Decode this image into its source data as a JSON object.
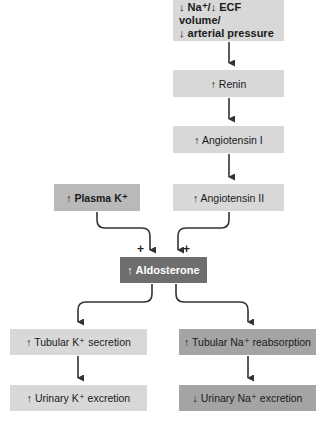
{
  "diagram": {
    "nodes": {
      "trigger": {
        "line1": "↓ Na⁺/↓ ECF volume/",
        "line2": "↓ arterial pressure"
      },
      "renin": "↑ Renin",
      "angiotensin_1": "↑ Angiotensin I",
      "angiotensin_2": "↑ Angiotensin II",
      "plasma_k": "↑ Plasma K⁺",
      "aldosterone": "↑ Aldosterone",
      "tubular_k_secretion": "↑ Tubular K⁺ secretion",
      "urinary_k_excretion": "↑ Urinary K⁺ excretion",
      "tubular_na_reabsorption": "↑ Tubular Na⁺ reabsorption",
      "urinary_na_excretion": "↓ Urinary Na⁺ excretion"
    },
    "signs": {
      "plasma_k_to_aldosterone": "+",
      "angiotensin_2_to_aldosterone": "+"
    },
    "edges": [
      [
        "trigger",
        "renin"
      ],
      [
        "renin",
        "angiotensin_1"
      ],
      [
        "angiotensin_1",
        "angiotensin_2"
      ],
      [
        "angiotensin_2",
        "aldosterone"
      ],
      [
        "plasma_k",
        "aldosterone"
      ],
      [
        "aldosterone",
        "tubular_k_secretion"
      ],
      [
        "aldosterone",
        "tubular_na_reabsorption"
      ],
      [
        "tubular_k_secretion",
        "urinary_k_excretion"
      ],
      [
        "tubular_na_reabsorption",
        "urinary_na_excretion"
      ]
    ],
    "colors": {
      "light_box": "#d8d8d8",
      "mid_box": "#b9b9b9",
      "dark_box": "#6e6e6e",
      "na_box": "#a4a4a4",
      "arrow": "#333333"
    }
  }
}
